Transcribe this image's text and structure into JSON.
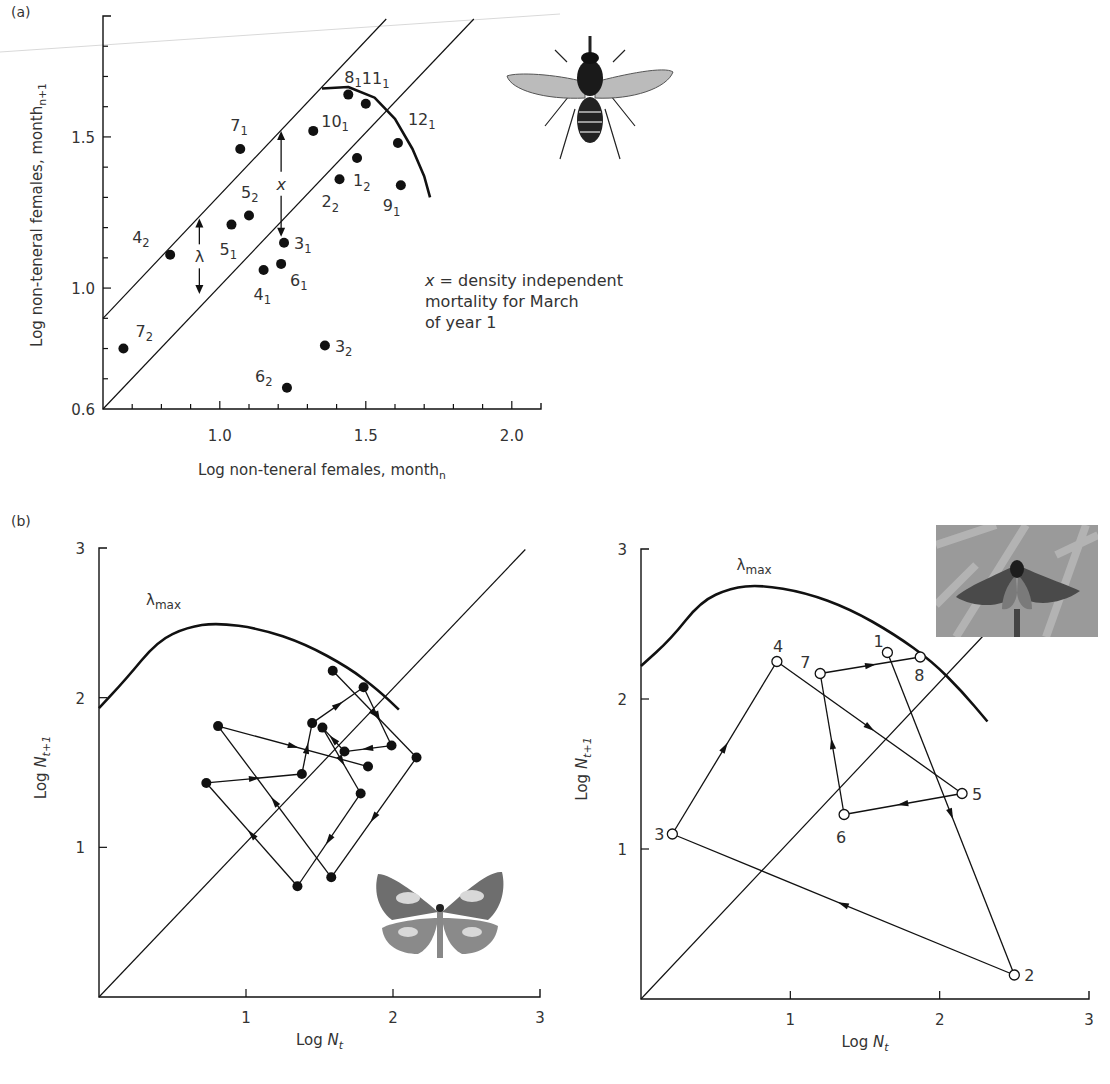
{
  "panels": {
    "a_label": "(a)",
    "b_label": "(b)"
  },
  "annotation": {
    "line1_var": "x",
    "line1_rest": " = density independent",
    "line2": "mortality for March",
    "line3": "of year 1"
  },
  "images": {
    "fly": "fly-illustration",
    "butterfly": "butterfly-photo",
    "moth": "moth-photo"
  },
  "colors": {
    "ink": "#111111",
    "text": "#333333",
    "scan_line": "#d9d9d9"
  },
  "chart_data": [
    {
      "id": "a",
      "type": "scatter",
      "title": "",
      "xlabel": "Log non-teneral females, month",
      "xlabel_sub": "n",
      "ylabel": "Log non-teneral females, month",
      "ylabel_sub": "n+1",
      "xlim": [
        0.6,
        2.1
      ],
      "ylim": [
        0.6,
        1.9
      ],
      "xticks": [
        1.0,
        1.5,
        2.0
      ],
      "xtick_labels": [
        "1.0",
        "1.5",
        "2.0"
      ],
      "xminor_step": 0.1,
      "yticks": [
        0.6,
        1.0,
        1.5
      ],
      "ytick_labels": [
        "0.6",
        "1.0",
        "1.5"
      ],
      "yminor_step": 0.1,
      "grid": false,
      "points": [
        {
          "label": "7",
          "sub": "2",
          "x": 0.67,
          "y": 0.8,
          "lx": 12,
          "ly": -12
        },
        {
          "label": "4",
          "sub": "2",
          "x": 0.83,
          "y": 1.11,
          "lx": -38,
          "ly": -12
        },
        {
          "label": "5",
          "sub": "1",
          "x": 1.04,
          "y": 1.21,
          "lx": -12,
          "ly": 30
        },
        {
          "label": "5",
          "sub": "2",
          "x": 1.1,
          "y": 1.24,
          "lx": -8,
          "ly": -18
        },
        {
          "label": "7",
          "sub": "1",
          "x": 1.07,
          "y": 1.46,
          "lx": -10,
          "ly": -18
        },
        {
          "label": "4",
          "sub": "1",
          "x": 1.15,
          "y": 1.06,
          "lx": -10,
          "ly": 30
        },
        {
          "label": "6",
          "sub": "1",
          "x": 1.21,
          "y": 1.08,
          "lx": 9,
          "ly": 22
        },
        {
          "label": "3",
          "sub": "1",
          "x": 1.22,
          "y": 1.15,
          "lx": 10,
          "ly": 6
        },
        {
          "label": "6",
          "sub": "2",
          "x": 1.23,
          "y": 0.67,
          "lx": -32,
          "ly": -6
        },
        {
          "label": "10",
          "sub": "1",
          "x": 1.32,
          "y": 1.52,
          "lx": 8,
          "ly": -4
        },
        {
          "label": "3",
          "sub": "2",
          "x": 1.36,
          "y": 0.81,
          "lx": 10,
          "ly": 6
        },
        {
          "label": "2",
          "sub": "2",
          "x": 1.41,
          "y": 1.36,
          "lx": -18,
          "ly": 28
        },
        {
          "label": "8",
          "sub": "1",
          "x": 1.44,
          "y": 1.64,
          "lx": -4,
          "ly": -12
        },
        {
          "label": "1",
          "sub": "2",
          "x": 1.47,
          "y": 1.43,
          "lx": -4,
          "ly": 28
        },
        {
          "label": "11",
          "sub": "1",
          "x": 1.5,
          "y": 1.61,
          "lx": -4,
          "ly": -20
        },
        {
          "label": "12",
          "sub": "1",
          "x": 1.61,
          "y": 1.48,
          "lx": 10,
          "ly": -18
        },
        {
          "label": "9",
          "sub": "1",
          "x": 1.62,
          "y": 1.34,
          "lx": -18,
          "ly": 26
        }
      ],
      "lines": [
        {
          "name": "upper-bound",
          "from": [
            0.6,
            0.9
          ],
          "to": [
            1.57,
            1.89
          ]
        },
        {
          "name": "replacement",
          "from": [
            0.6,
            0.6
          ],
          "to": [
            1.87,
            1.89
          ]
        }
      ],
      "curve": {
        "name": "density-dependence",
        "points": [
          [
            1.35,
            1.66
          ],
          [
            1.44,
            1.665
          ],
          [
            1.53,
            1.63
          ],
          [
            1.6,
            1.56
          ],
          [
            1.66,
            1.46
          ],
          [
            1.7,
            1.37
          ],
          [
            1.72,
            1.3
          ]
        ]
      },
      "annotations": [
        {
          "symbol": "λ",
          "x": 0.93,
          "from_y": 1.23,
          "to_y": 0.98
        },
        {
          "symbol": "x",
          "x": 1.21,
          "from_y": 1.52,
          "to_y": 1.17
        }
      ]
    },
    {
      "id": "b-left",
      "type": "line",
      "title": "",
      "xlabel": "Log N",
      "xlabel_sub": "t",
      "ylabel": "Log N",
      "ylabel_sub": "t+1",
      "xlim": [
        0,
        3
      ],
      "ylim": [
        0,
        3
      ],
      "xticks": [
        1,
        2,
        3
      ],
      "xtick_labels": [
        "1",
        "2",
        "3"
      ],
      "yticks": [
        1,
        2,
        3
      ],
      "ytick_labels": [
        "1",
        "2",
        "3"
      ],
      "grid": false,
      "curve_label": "λ",
      "curve_label_sub": "max",
      "curve_label_pos": [
        0.32,
        2.62
      ],
      "curve": [
        [
          0,
          1.93
        ],
        [
          0.18,
          2.12
        ],
        [
          0.4,
          2.38
        ],
        [
          0.6,
          2.47
        ],
        [
          0.8,
          2.5
        ],
        [
          1.1,
          2.46
        ],
        [
          1.4,
          2.36
        ],
        [
          1.7,
          2.2
        ],
        [
          1.9,
          2.05
        ],
        [
          2.04,
          1.92
        ]
      ],
      "diagonal": {
        "from": [
          0,
          0
        ],
        "to": [
          2.9,
          2.99
        ]
      },
      "points": [
        {
          "id": "A",
          "x": 1.59,
          "y": 2.18
        },
        {
          "id": "B",
          "x": 1.8,
          "y": 2.07
        },
        {
          "id": "C",
          "x": 0.81,
          "y": 1.81
        },
        {
          "id": "D",
          "x": 1.45,
          "y": 1.83
        },
        {
          "id": "E",
          "x": 1.52,
          "y": 1.8
        },
        {
          "id": "F",
          "x": 1.99,
          "y": 1.68
        },
        {
          "id": "G",
          "x": 1.67,
          "y": 1.64
        },
        {
          "id": "H",
          "x": 2.16,
          "y": 1.6
        },
        {
          "id": "I",
          "x": 1.83,
          "y": 1.54
        },
        {
          "id": "J",
          "x": 1.38,
          "y": 1.49
        },
        {
          "id": "K",
          "x": 0.73,
          "y": 1.43
        },
        {
          "id": "L",
          "x": 1.78,
          "y": 1.36
        },
        {
          "id": "M",
          "x": 1.58,
          "y": 0.8
        },
        {
          "id": "N",
          "x": 1.35,
          "y": 0.74
        }
      ],
      "segments": [
        [
          "A",
          "H"
        ],
        [
          "H",
          "M"
        ],
        [
          "M",
          "C"
        ],
        [
          "C",
          "I"
        ],
        [
          "K",
          "J"
        ],
        [
          "J",
          "D"
        ],
        [
          "D",
          "B"
        ],
        [
          "B",
          "F"
        ],
        [
          "F",
          "G"
        ],
        [
          "G",
          "E"
        ],
        [
          "E",
          "L"
        ],
        [
          "L",
          "N"
        ],
        [
          "N",
          "K"
        ]
      ],
      "marker": "filled"
    },
    {
      "id": "b-right",
      "type": "line",
      "title": "",
      "xlabel": "Log N",
      "xlabel_sub": "t",
      "ylabel": "Log N",
      "ylabel_sub": "t+1",
      "xlim": [
        0,
        3
      ],
      "ylim": [
        0,
        3
      ],
      "xticks": [
        1,
        2,
        3
      ],
      "xtick_labels": [
        "1",
        "2",
        "3"
      ],
      "yticks": [
        1,
        2,
        3
      ],
      "ytick_labels": [
        "1",
        "2",
        "3"
      ],
      "grid": false,
      "curve_label": "λ",
      "curve_label_sub": "max",
      "curve_label_pos": [
        0.64,
        2.86
      ],
      "curve": [
        [
          0,
          2.22
        ],
        [
          0.2,
          2.4
        ],
        [
          0.4,
          2.65
        ],
        [
          0.6,
          2.74
        ],
        [
          0.8,
          2.76
        ],
        [
          1.1,
          2.71
        ],
        [
          1.4,
          2.6
        ],
        [
          1.7,
          2.43
        ],
        [
          1.95,
          2.25
        ],
        [
          2.15,
          2.05
        ],
        [
          2.32,
          1.85
        ]
      ],
      "diagonal": {
        "from": [
          0,
          0
        ],
        "to": [
          2.3,
          2.43
        ]
      },
      "points": [
        {
          "id": "1",
          "x": 1.65,
          "y": 2.31,
          "lx": -14,
          "ly": -6
        },
        {
          "id": "2",
          "x": 2.5,
          "y": 0.16,
          "lx": 10,
          "ly": 6
        },
        {
          "id": "3",
          "x": 0.21,
          "y": 1.1,
          "lx": -18,
          "ly": 6
        },
        {
          "id": "4",
          "x": 0.91,
          "y": 2.25,
          "lx": -4,
          "ly": -10
        },
        {
          "id": "5",
          "x": 2.15,
          "y": 1.37,
          "lx": 10,
          "ly": 6
        },
        {
          "id": "6",
          "x": 1.36,
          "y": 1.23,
          "lx": -8,
          "ly": 28
        },
        {
          "id": "7",
          "x": 1.2,
          "y": 2.17,
          "lx": -20,
          "ly": -6
        },
        {
          "id": "8",
          "x": 1.87,
          "y": 2.28,
          "lx": -6,
          "ly": 24
        }
      ],
      "segments": [
        [
          "1",
          "2"
        ],
        [
          "2",
          "3"
        ],
        [
          "3",
          "4"
        ],
        [
          "4",
          "5"
        ],
        [
          "5",
          "6"
        ],
        [
          "6",
          "7"
        ],
        [
          "7",
          "8"
        ]
      ],
      "marker": "open"
    }
  ]
}
